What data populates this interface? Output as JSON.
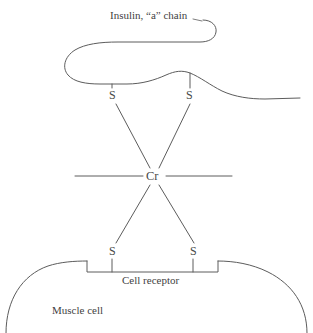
{
  "diagram": {
    "title": "Insulin, “a” chain",
    "background_color": "#ffffff",
    "line_color": "#5c5c5c",
    "text_color": "#3f3f3f",
    "width": 313,
    "height": 333,
    "labels": {
      "insulin_chain": "Insulin, “a” chain",
      "chromium": "Cr",
      "sulfur_top_left": "S",
      "sulfur_top_right": "S",
      "sulfur_bottom_left": "S",
      "sulfur_bottom_right": "S",
      "cell_receptor": "Cell receptor",
      "muscle_cell": "Muscle cell"
    },
    "elements": {
      "insulin_chain_icon": "polypeptide-chain-curve",
      "chromium_atom_icon": "cr-atom",
      "sulfur_atom_icon": "s-atom",
      "membrane_icon": "cell-membrane-arc",
      "receptor_icon": "receptor-notch",
      "bond_icon": "bond-line"
    }
  }
}
